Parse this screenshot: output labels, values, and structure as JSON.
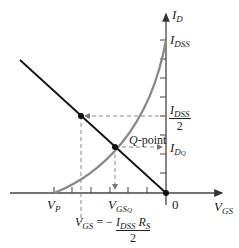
{
  "diagram": {
    "type": "jfet-self-bias-graphical-analysis",
    "colors": {
      "axes": "#444444",
      "load_line": "#111111",
      "transfer_curve": "#888888",
      "dashed": "#888888"
    },
    "axes": {
      "y_label": "I",
      "y_label_sub": "D",
      "x_label": "V",
      "x_label_sub": "GS",
      "origin_label": "0"
    },
    "labels": {
      "idss_main": "I",
      "idss_sub": "DSS",
      "half_idss_num_main": "I",
      "half_idss_num_sub": "DSS",
      "half_idss_den": "2",
      "idq_main": "I",
      "idq_sub": "D",
      "idq_subsub": "Q",
      "qpoint_q": "Q",
      "qpoint_text": "-point",
      "vp_main": "V",
      "vp_sub": "P",
      "vgsq_main": "V",
      "vgsq_sub": "GS",
      "vgsq_subsub": "Q",
      "eq_lhs_main": "V",
      "eq_lhs_sub": "GS",
      "eq_eq": "= −",
      "eq_num_i": "I",
      "eq_num_i_sub": "DSS",
      "eq_num_r": "R",
      "eq_num_r_sub": "S",
      "eq_den": "2"
    }
  }
}
